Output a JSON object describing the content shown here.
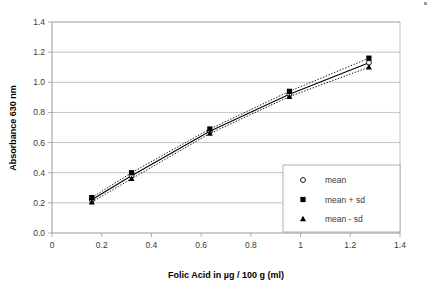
{
  "chart_data": {
    "type": "line",
    "title": "",
    "xlabel": "Folic Acid in µg / 100 g (ml)",
    "ylabel": "Absorbance 630 nm",
    "xlim": [
      0,
      1.4
    ],
    "ylim": [
      0,
      1.4
    ],
    "grid": "horizontal",
    "legend_position": "inside-right",
    "x_ticks": [
      "0",
      "0.2",
      "0.4",
      "0.6",
      "0.8",
      "1",
      "1.2",
      "1.4"
    ],
    "x_tick_values": [
      0,
      0.2,
      0.4,
      0.6,
      0.8,
      1.0,
      1.2,
      1.4
    ],
    "y_ticks": [
      "0.0",
      "0.2",
      "0.4",
      "0.6",
      "0.8",
      "1.0",
      "1.2",
      "1.4"
    ],
    "y_tick_values": [
      0.0,
      0.2,
      0.4,
      0.6,
      0.8,
      1.0,
      1.2,
      1.4
    ],
    "x": [
      0.16,
      0.32,
      0.635,
      0.955,
      1.275
    ],
    "series": [
      {
        "name": "mean",
        "marker": "circle",
        "line": "solid",
        "values": [
          0.22,
          0.38,
          0.675,
          0.92,
          1.13
        ]
      },
      {
        "name": "mean + sd",
        "marker": "square",
        "line": "dotted",
        "values": [
          0.235,
          0.4,
          0.69,
          0.94,
          1.16
        ]
      },
      {
        "name": "mean - sd",
        "marker": "triangle",
        "line": "dotted",
        "values": [
          0.205,
          0.36,
          0.66,
          0.905,
          1.1
        ]
      }
    ]
  },
  "legend": {
    "items": [
      {
        "label": "mean"
      },
      {
        "label": "mean + sd"
      },
      {
        "label": "mean - sd"
      }
    ]
  },
  "colors": {
    "series": "#000000",
    "grid": "#b4b4b4",
    "axis": "#9a9a9a",
    "text": "#3a3a3a",
    "background": "#ffffff"
  }
}
